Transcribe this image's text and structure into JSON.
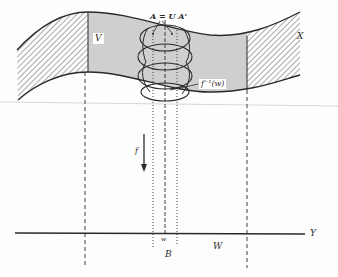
{
  "diagram": {
    "type": "fibration-preimage-illustration",
    "colors": {
      "stroke": "#2a2a2a",
      "shaded_region": "#cfcfcf",
      "hatch": "#555555",
      "background": "#fdfdfd",
      "faint_rule": "#d6d6d6"
    },
    "labels": {
      "V": "V",
      "X": "X",
      "A_union": "A = U A'",
      "preimage": "f⁻¹(w)",
      "f": "f",
      "w": "w",
      "B": "B",
      "W": "W",
      "Y": "Y"
    },
    "elements": [
      {
        "id": "space-X",
        "desc": "curved band representing total space X"
      },
      {
        "id": "region-V",
        "desc": "shaded middle region V of X"
      },
      {
        "id": "hatched-ends",
        "desc": "hatched complements at left and right ends"
      },
      {
        "id": "cover-A",
        "desc": "stack of ellipses A' covering the fiber f⁻¹(w)"
      },
      {
        "id": "map-f",
        "desc": "downward arrow labeled f"
      },
      {
        "id": "base-Y",
        "desc": "horizontal line Y with point w, neighborhood B and set W"
      }
    ]
  }
}
